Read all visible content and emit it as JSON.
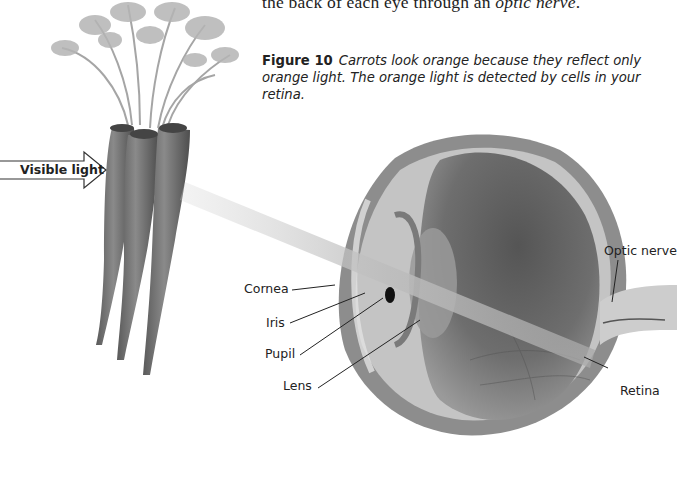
{
  "body_text": {
    "prefix": "the back of each eye through an ",
    "emphasis": "optic nerve",
    "suffix": "."
  },
  "caption": {
    "figure_number": "Figure 10",
    "text": "Carrots look orange because they reflect only orange light. The orange light is detected by cells in your retina."
  },
  "illustration": {
    "arrow_label": "Visible light",
    "eye_labels": {
      "cornea": "Cornea",
      "iris": "Iris",
      "pupil": "Pupil",
      "lens": "Lens",
      "optic_nerve": "Optic nerve",
      "retina": "Retina"
    }
  }
}
